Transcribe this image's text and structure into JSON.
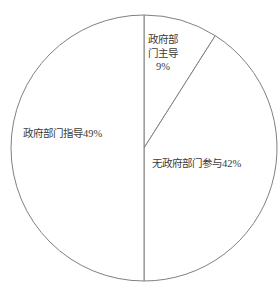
{
  "chart_data": {
    "type": "pie",
    "title": "",
    "subtitle": "",
    "xlabel": "",
    "ylabel": "",
    "grid": false,
    "legend": "none",
    "label_style": "inside-slice-with-percent",
    "total_percent": 100,
    "stroke_color": "#808080",
    "slice_fill": "#ffffff",
    "background": "#ffffff",
    "categories": [
      "政府部门主导",
      "无政府部门参与",
      "政府部门指导"
    ],
    "values": [
      9,
      42,
      49
    ],
    "slices": [
      {
        "id": "gov-led",
        "category": "政府部门主导",
        "value": 9,
        "percent_label": "9%",
        "full_label": "政府部门主导9%",
        "label_lines": [
          "政府部",
          "门主导",
          "9%"
        ],
        "start_angle_deg": 0,
        "end_angle_deg": 32.4,
        "fill": "#ffffff"
      },
      {
        "id": "no-gov",
        "category": "无政府部门参与",
        "value": 42,
        "percent_label": "42%",
        "full_label": "无政府部门参与42%",
        "label_lines": [
          "无政府部门参与42%"
        ],
        "start_angle_deg": 32.4,
        "end_angle_deg": 180,
        "fill": "#ffffff"
      },
      {
        "id": "gov-guide",
        "category": "政府部门指导",
        "value": 49,
        "percent_label": "49%",
        "full_label": "政府部门指导49%",
        "label_lines": [
          "政府部门指导49%"
        ],
        "start_angle_deg": 180,
        "end_angle_deg": 360,
        "fill": "#ffffff"
      }
    ],
    "geometry": {
      "center_x": 144,
      "center_y": 148,
      "radius": 133
    }
  },
  "labels": {
    "gov_led": {
      "line1": "政府部",
      "line2": "门主导",
      "line3": "9%"
    },
    "gov_guide": {
      "text": "政府部门指导49%"
    },
    "no_gov": {
      "text": "无政府部门参与42%"
    }
  }
}
